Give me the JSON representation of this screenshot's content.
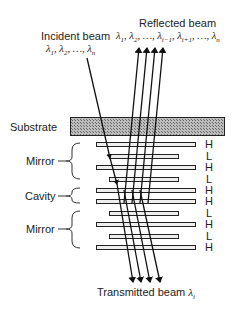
{
  "labels": {
    "incident_title": "Incident beam",
    "incident_lambdas": "λ1, λ2, …, λn",
    "reflected_title": "Reflected beam",
    "reflected_lambdas": "λ1, λ2, …, λi−1, λi+1, …, λn",
    "substrate": "Substrate",
    "mirror_top": "Mirror",
    "cavity": "Cavity",
    "mirror_bottom": "Mirror",
    "transmitted": "Transmitted beam λi"
  },
  "layers": [
    {
      "type": "H",
      "label": "H"
    },
    {
      "type": "L",
      "label": "L"
    },
    {
      "type": "H",
      "label": "H"
    },
    {
      "type": "L",
      "label": "L"
    },
    {
      "type": "H",
      "label": "H"
    },
    {
      "type": "H",
      "label": "H"
    },
    {
      "type": "L",
      "label": "L"
    },
    {
      "type": "H",
      "label": "H"
    },
    {
      "type": "L",
      "label": "L"
    },
    {
      "type": "H",
      "label": "H"
    }
  ],
  "colors": {
    "line": "#111111",
    "substrate_fill": "#9a9a9a",
    "layer_fill": "#eeeeee"
  }
}
